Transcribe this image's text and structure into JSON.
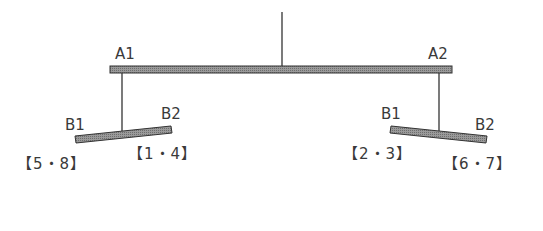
{
  "diagram": {
    "type": "mobile-balance",
    "top_beam": {
      "left_label": "A1",
      "right_label": "A2"
    },
    "left_beam": {
      "left_label": "B1",
      "right_label": "B2",
      "left_group": "【5・8】",
      "right_group": "【1・4】"
    },
    "right_beam": {
      "left_label": "B1",
      "right_label": "B2",
      "left_group": "【2・3】",
      "right_group": "【6・7】"
    },
    "colors": {
      "beam_fill": "#8a8a8a",
      "beam_stroke": "#333333",
      "string": "#333333"
    }
  }
}
